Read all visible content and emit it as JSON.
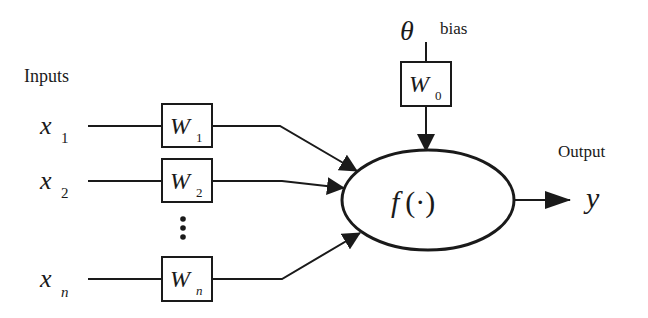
{
  "diagram": {
    "labels": {
      "inputs": "Inputs",
      "output": "Output",
      "bias": "bias",
      "theta": "θ",
      "function": "f (·)",
      "y": "y",
      "ellipsis": "⋮"
    },
    "inputs": [
      {
        "var": "x",
        "sub": "1",
        "weight": "W",
        "weight_sub": "1"
      },
      {
        "var": "x",
        "sub": "2",
        "weight": "W",
        "weight_sub": "2"
      },
      {
        "var": "x",
        "sub": "n",
        "weight": "W",
        "weight_sub": "n"
      }
    ],
    "bias_weight": {
      "weight": "W",
      "weight_sub": "0"
    },
    "colors": {
      "stroke": "#1a1a1a",
      "background": "#ffffff"
    }
  }
}
